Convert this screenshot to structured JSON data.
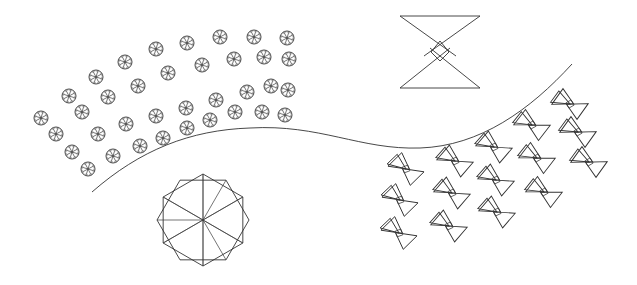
{
  "canvas": {
    "width": 637,
    "height": 285,
    "background": "#ffffff",
    "stroke_color": "#333333"
  },
  "curve": {
    "path": "M92,192 C140,150 190,130 250,128 C320,124 360,150 420,148 C480,146 530,110 572,64"
  },
  "small_circles": {
    "radius": 7,
    "spokes": 8,
    "centers": [
      [
        41,
        118
      ],
      [
        69,
        96
      ],
      [
        96,
        77
      ],
      [
        125,
        62
      ],
      [
        156,
        49
      ],
      [
        187,
        43
      ],
      [
        220,
        37
      ],
      [
        254,
        37
      ],
      [
        287,
        38
      ],
      [
        56,
        134
      ],
      [
        82,
        112
      ],
      [
        108,
        97
      ],
      [
        138,
        86
      ],
      [
        168,
        73
      ],
      [
        202,
        65
      ],
      [
        234,
        59
      ],
      [
        264,
        57
      ],
      [
        289,
        59
      ],
      [
        72,
        152
      ],
      [
        98,
        134
      ],
      [
        126,
        124
      ],
      [
        156,
        116
      ],
      [
        186,
        108
      ],
      [
        216,
        100
      ],
      [
        247,
        92
      ],
      [
        271,
        86
      ],
      [
        288,
        90
      ],
      [
        88,
        169
      ],
      [
        113,
        156
      ],
      [
        140,
        146
      ],
      [
        163,
        138
      ],
      [
        187,
        128
      ],
      [
        210,
        120
      ],
      [
        235,
        112
      ],
      [
        262,
        112
      ],
      [
        285,
        115
      ]
    ]
  },
  "big_star": {
    "cx": 203,
    "cy": 220,
    "r": 46,
    "points": 12,
    "layers": 2
  },
  "big_bowtie": {
    "cx": 440,
    "cy": 52,
    "halfwidth": 40,
    "halfheight": 36,
    "diamond": 9
  },
  "small_bowties": {
    "size": 16,
    "items": [
      {
        "c": [
          406,
          169
        ],
        "rot": -20
      },
      {
        "c": [
          400,
          200
        ],
        "rot": -20
      },
      {
        "c": [
          399,
          233
        ],
        "rot": -20
      },
      {
        "c": [
          455,
          161
        ],
        "rot": -25
      },
      {
        "c": [
          452,
          193
        ],
        "rot": -25
      },
      {
        "c": [
          449,
          226
        ],
        "rot": -25
      },
      {
        "c": [
          494,
          147
        ],
        "rot": -25
      },
      {
        "c": [
          496,
          180
        ],
        "rot": -25
      },
      {
        "c": [
          497,
          212
        ],
        "rot": -25
      },
      {
        "c": [
          532,
          125
        ],
        "rot": -28
      },
      {
        "c": [
          537,
          158
        ],
        "rot": -28
      },
      {
        "c": [
          544,
          192
        ],
        "rot": -28
      },
      {
        "c": [
          570,
          104
        ],
        "rot": -30
      },
      {
        "c": [
          578,
          132
        ],
        "rot": -30
      },
      {
        "c": [
          589,
          162
        ],
        "rot": -30
      }
    ]
  }
}
